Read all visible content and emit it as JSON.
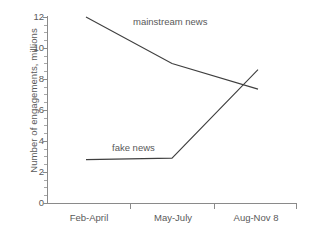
{
  "chart_data": {
    "type": "line",
    "title": "",
    "xlabel": "",
    "ylabel": "Number of engagements, millions",
    "categories": [
      "Feb-April",
      "May-July",
      "Aug-Nov 8"
    ],
    "ylim": [
      0,
      12
    ],
    "ytick_labels": [
      "0",
      "2",
      "4",
      "6",
      "8",
      "10",
      "12"
    ],
    "ytick_values": [
      0,
      2,
      4,
      6,
      8,
      10,
      12
    ],
    "minor_tick_step": 0.5,
    "grid": false,
    "legend_position": "inline-annotation",
    "series": [
      {
        "name": "mainstream news",
        "label": "mainstream news",
        "values": [
          12.0,
          9.0,
          7.35
        ],
        "color": "#3f3f3f"
      },
      {
        "name": "fake news",
        "label": "fake news",
        "values": [
          2.8,
          2.9,
          8.6
        ],
        "color": "#3f3f3f"
      }
    ],
    "annotations": [
      {
        "text": "mainstream news",
        "x_px": 133,
        "y_px": 17
      },
      {
        "text": "fake news",
        "x_px": 112,
        "y_px": 143
      }
    ]
  },
  "axis": {
    "y_title": "Number of engagements, millions",
    "y_ticks": [
      {
        "label": "12",
        "value": 12
      },
      {
        "label": "10",
        "value": 10
      },
      {
        "label": "8",
        "value": 8
      },
      {
        "label": "6",
        "value": 6
      },
      {
        "label": "4",
        "value": 4
      },
      {
        "label": "2",
        "value": 2
      },
      {
        "label": "0",
        "value": 0
      }
    ],
    "x_ticks": [
      {
        "label": "Feb-April"
      },
      {
        "label": "May-July"
      },
      {
        "label": "Aug-Nov 8"
      }
    ]
  },
  "colors": {
    "line": "#3f3f3f",
    "axis": "#8a8a8a",
    "text": "#595959",
    "background": "#ffffff"
  }
}
